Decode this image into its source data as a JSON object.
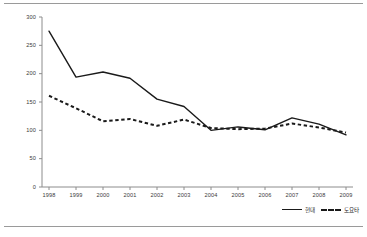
{
  "chart_data": {
    "type": "line",
    "title": "",
    "subtitle": "",
    "xlabel": "",
    "ylabel": "",
    "categories": [
      "1998",
      "1999",
      "2000",
      "2001",
      "2002",
      "2003",
      "2004",
      "2005",
      "2006",
      "2007",
      "2008",
      "2009"
    ],
    "x": [
      1998,
      1999,
      2000,
      2001,
      2002,
      2003,
      2004,
      2005,
      2006,
      2007,
      2008,
      2009
    ],
    "series": [
      {
        "name": "현대",
        "style": "solid",
        "color": "#1a1a1a",
        "values": [
          275,
          194,
          203,
          192,
          155,
          142,
          100,
          106,
          101,
          122,
          111,
          92
        ]
      },
      {
        "name": "도요타",
        "style": "dashed",
        "color": "#1a1a1a",
        "values": [
          161,
          139,
          116,
          120,
          108,
          119,
          104,
          102,
          103,
          112,
          105,
          96
        ]
      }
    ],
    "ylim": [
      0,
      300
    ],
    "yticks": [
      0,
      50,
      100,
      150,
      200,
      250,
      300
    ],
    "ytick_labels": [
      "0",
      "50",
      "100",
      "150",
      "200",
      "250",
      "300"
    ],
    "xtick_labels": [
      "1998",
      "1999",
      "2000",
      "2001",
      "2002",
      "2003",
      "2004",
      "2005",
      "2006",
      "2007",
      "2008",
      "2009"
    ],
    "grid": false,
    "legend_position": "bottom-right",
    "legend_entries": [
      "현대",
      "도요타"
    ],
    "axis_color": "#8c8c8c",
    "text_color": "#3a3a3a"
  }
}
